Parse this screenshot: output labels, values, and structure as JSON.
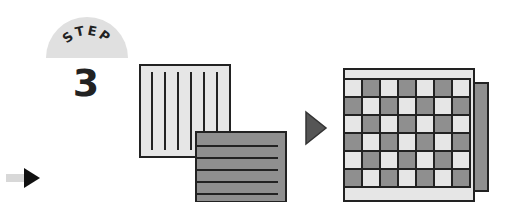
{
  "step": {
    "label": "STEP",
    "number": "3"
  },
  "icons": {
    "vertical_sheet": "vertical-striped-sheet",
    "horizontal_sheet": "horizontal-striped-sheet",
    "arrow": "right-triangle-arrow",
    "woven": "woven-checkerboard-sheet",
    "nav": "next-arrow"
  },
  "colors": {
    "light": "#e6e6e6",
    "dark": "#8f8f8f",
    "line": "#222222",
    "badge": "#e0e0e0"
  }
}
